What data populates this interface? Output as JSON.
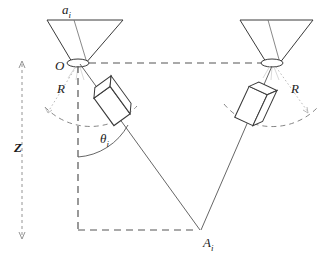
{
  "figure": {
    "type": "line-diagram",
    "background_color": "#ffffff",
    "stroke_color": "#3a3a3a",
    "dash_color": "#555555",
    "text_color": "#1b1b1b"
  },
  "labels": {
    "aperture_size": {
      "base": "a",
      "sub": "i",
      "x": 62,
      "y": 14
    },
    "origin": {
      "base": "O",
      "sub": "",
      "x": 55,
      "y": 70
    },
    "radius_left": {
      "base": "R",
      "sub": "",
      "x": 57,
      "y": 93
    },
    "radius_right": {
      "base": "R",
      "sub": "",
      "x": 291,
      "y": 93
    },
    "theta": {
      "base": "θ",
      "sub": "i",
      "x": 100,
      "y": 143
    },
    "depth": {
      "base": "Z",
      "sub": "",
      "x": 14,
      "y": 152
    },
    "target_point": {
      "base": "A",
      "sub": "i",
      "x": 203,
      "y": 247
    }
  },
  "geometry": {
    "left_cone": {
      "top_left": [
        47,
        20
      ],
      "top_right": [
        123,
        20
      ],
      "aperture_center": [
        78,
        63
      ],
      "aperture_rx": 11,
      "aperture_ry": 4,
      "inner_line_top": [
        74,
        20
      ]
    },
    "right_cone": {
      "top_left": [
        240,
        20
      ],
      "top_right": [
        313,
        20
      ],
      "aperture_center": [
        272,
        63
      ],
      "aperture_rx": 11,
      "aperture_ry": 4,
      "inner_line_top": [
        268,
        20
      ]
    },
    "baseline": {
      "from": [
        88,
        63
      ],
      "to": [
        263,
        63
      ]
    },
    "z_axis": {
      "x": 22,
      "from_y": 62,
      "to_y": 238
    },
    "vertical_drop": {
      "x": 78,
      "from_y": 63,
      "to_y": 230
    },
    "bottom_dash": {
      "from": [
        78,
        230
      ],
      "to": [
        198,
        230
      ]
    },
    "left_ray": {
      "from": [
        78,
        63
      ],
      "to": [
        200,
        230
      ]
    },
    "right_ray": {
      "from": [
        272,
        63
      ],
      "to": [
        200,
        230
      ]
    },
    "left_arc_radius": 63,
    "right_arc_radius": 63,
    "theta_arc_radius": 62,
    "left_box": {
      "cx": 112,
      "cy": 106,
      "w": 20,
      "h": 34,
      "depth": 9,
      "angle": -36
    },
    "right_box": {
      "cx": 251,
      "cy": 106,
      "w": 20,
      "h": 34,
      "depth": 9,
      "angle": 25
    }
  },
  "annotations": {
    "z_axis_note": "double-headed dashed vertical arrow",
    "baseline_note": "dashed horizontal baseline between the two camera centers",
    "arc_note": "dashed circular arcs of radius R about each camera center"
  }
}
